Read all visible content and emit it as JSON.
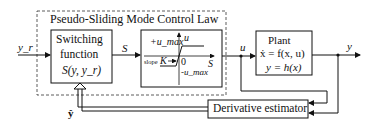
{
  "controller": {
    "title": "Pseudo-Sliding Mode Control Law",
    "switching": {
      "line1": "Switching",
      "line2": "function",
      "formula": "S(y, y_r)"
    },
    "saturation": {
      "upper": "+u_max",
      "lower": "-u_max",
      "axis_y": "u",
      "axis_x": "S",
      "origin": "0",
      "slope_label": "slope",
      "slope_symbol": "K"
    }
  },
  "plant": {
    "title": "Plant",
    "eq1": "ẋ = f(x, u)",
    "eq2": "y = h(x)"
  },
  "estimator": {
    "label": "Derivative estimator"
  },
  "signals": {
    "input": "y_r",
    "s": "S",
    "u": "u",
    "y": "y",
    "yhat": "ŷ"
  }
}
